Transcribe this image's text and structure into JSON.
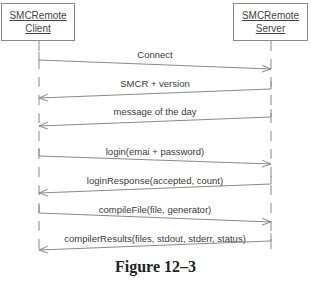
{
  "diagram": {
    "type": "sequence",
    "actors": [
      {
        "id": "client",
        "line1": "SMCRemote",
        "line2": "Client",
        "lifeline_x": 39
      },
      {
        "id": "server",
        "line1": "SMCRemote",
        "line2": "Server",
        "lifeline_x": 271
      }
    ],
    "messages": [
      {
        "label": "Connect",
        "from": "client",
        "to": "server",
        "y1": 60,
        "y2": 69,
        "label_y": 49
      },
      {
        "label": "SMCR + version",
        "from": "server",
        "to": "client",
        "y1": 89,
        "y2": 98,
        "label_y": 78
      },
      {
        "label": "message of the day",
        "from": "server",
        "to": "client",
        "y1": 117,
        "y2": 126,
        "label_y": 106
      },
      {
        "label": "login(emai + password)",
        "from": "client",
        "to": "server",
        "y1": 156,
        "y2": 164,
        "label_y": 146
      },
      {
        "label": "loginResponse(accepted, count)",
        "from": "server",
        "to": "client",
        "y1": 184,
        "y2": 193,
        "label_y": 175
      },
      {
        "label": "compileFile(file, generator)",
        "from": "client",
        "to": "server",
        "y1": 213,
        "y2": 222,
        "label_y": 204
      },
      {
        "label": "compilerResults(files, stdout, stderr, status)",
        "from": "server",
        "to": "client",
        "y1": 241,
        "y2": 250,
        "label_y": 233
      }
    ],
    "caption": "Figure 12–3",
    "colors": {
      "line": "#8a8a8a",
      "text": "#3a3a3a"
    }
  }
}
